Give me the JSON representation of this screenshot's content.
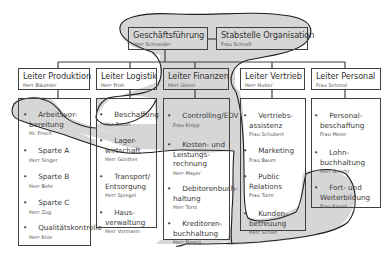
{
  "colors": {
    "line": "#404040",
    "shade": "#d6d6d6",
    "outline": "#1e1e1e",
    "text": "#3a3a3a",
    "background": "#ffffff"
  },
  "top": {
    "management": {
      "title": "Geschäftsführung",
      "person": "Herr Schneider"
    },
    "staff": {
      "title": "Stabstelle Organisation",
      "person": "Frau Schnell"
    }
  },
  "departments": [
    {
      "title": "Leiter Produktion",
      "person": "Herr Bäumler",
      "items": [
        {
          "label": "Arbeitsvor-\nbereitung",
          "person": "Hr. Frisch"
        },
        {
          "label": "Sparte A",
          "person": "Herr Singer"
        },
        {
          "label": "Sparte B",
          "person": "Herr Behr"
        },
        {
          "label": "Sparte C",
          "person": "Herr Zug"
        },
        {
          "label": "Qualitätskontrolle",
          "person": "Herr Knie"
        }
      ]
    },
    {
      "title": "Leiter Logistik",
      "person": "Herr Froh",
      "items": [
        {
          "label": "Beschaffung",
          "person": "Her Baum"
        },
        {
          "label": "Lager-\nwirtschaft",
          "person": "Herr Günther"
        },
        {
          "label": "Transport/\nEntsorgung",
          "person": "Herr Spiegel"
        },
        {
          "label": "Haus-\nverwaltung",
          "person": "Herr Vormann"
        }
      ]
    },
    {
      "title": "Leiter Finanzen",
      "person": "Herr Glonn",
      "items": [
        {
          "label": "Controlling/EDV",
          "person": "Frau Knipp"
        },
        {
          "label": "Kosten- und\nLeistungs-\nrechnung",
          "person": "Herr Mayer"
        },
        {
          "label": "Debitorenbuch-\nhaltung",
          "person": "Herr Torst"
        },
        {
          "label": "Kreditoren-\nbuchhaltung",
          "person": "Herr Newig"
        }
      ]
    },
    {
      "title": "Leiter Vertrieb",
      "person": "Herr Huber",
      "items": [
        {
          "label": "Vertriebs-\nassistenz",
          "person": "Frau Schubert"
        },
        {
          "label": "Marketing",
          "person": "Frau Baum"
        },
        {
          "label": "Public\nRelations",
          "person": "Frau Turm"
        },
        {
          "label": "Kunden-\nbetreuung",
          "person": "Herr Schler"
        }
      ]
    },
    {
      "title": "Leiter Personal",
      "person": "Frau Schmid",
      "items": [
        {
          "label": "Personal-\nbeschaffung",
          "person": "Frau Meier"
        },
        {
          "label": "Lohn-\nbuchhaltung",
          "person": "Herr Gmehr"
        },
        {
          "label": "Fort- und\nWeiterbildung",
          "person": "Frau Kiesel"
        }
      ]
    }
  ],
  "bullet": "•"
}
